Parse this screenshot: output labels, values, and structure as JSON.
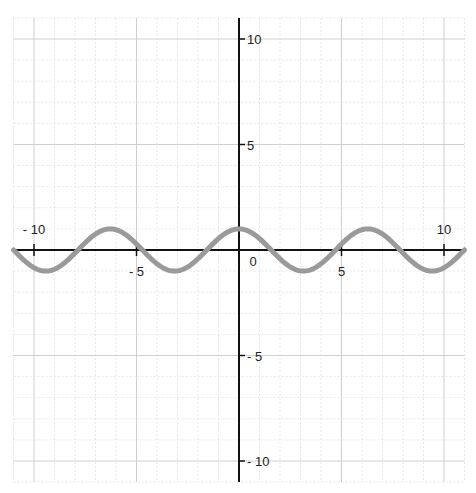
{
  "chart_data": {
    "type": "line",
    "title": "",
    "xlabel": "",
    "ylabel": "",
    "function": "y = cos(x)",
    "xlim": [
      -11,
      11
    ],
    "ylim": [
      -11,
      11
    ],
    "grid": true,
    "major_grid_step": 5,
    "minor_grid_step": 1,
    "x_tick_labels": [
      "-10",
      "-5",
      "0",
      "5",
      "10"
    ],
    "x_tick_values": [
      -10,
      -5,
      0,
      5,
      10
    ],
    "y_tick_labels": [
      "10",
      "5",
      "-5",
      "-10"
    ],
    "y_tick_values": [
      10,
      5,
      -5,
      -10
    ],
    "origin_label": "0",
    "series": [
      {
        "name": "cos(x)",
        "color": "#9a9a9a",
        "stroke_width": 5,
        "x": [
          -11,
          -9.42,
          -7.85,
          -6.28,
          -4.71,
          -3.14,
          -1.57,
          0,
          1.57,
          3.14,
          4.71,
          6.28,
          7.85,
          9.42,
          11
        ],
        "values": [
          0.0,
          -1,
          0,
          1,
          0,
          -1,
          0,
          1,
          0,
          -1,
          0,
          1,
          0,
          -1,
          0.0
        ]
      }
    ],
    "legend": null
  },
  "colors": {
    "axis": "#111111",
    "major_grid": "#cfcfcf",
    "minor_grid": "#e6e6e6",
    "curve": "#9a9a9a",
    "background": "#ffffff"
  },
  "layout": {
    "origin_px": [
      239,
      250
    ],
    "px_per_unit_x": 20.5,
    "px_per_unit_y": 21.1
  }
}
